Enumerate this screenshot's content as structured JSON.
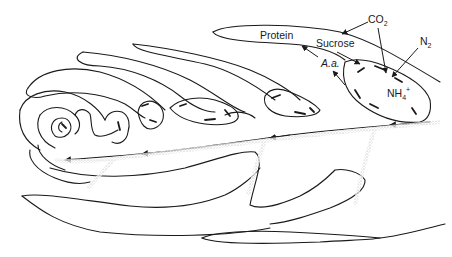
{
  "diagram": {
    "labels": {
      "protein": "Protein",
      "co2_main": "CO",
      "co2_sub": "2",
      "sucrose": "Sucrose",
      "n2_main": "N",
      "n2_sub": "2",
      "aa": "A.a.",
      "nh4_main": "NH",
      "nh4_sub": "4",
      "nh4_sup": "+"
    },
    "colors": {
      "line": "#1a1a1a",
      "stipple": "#9a9a9a",
      "background": "#ffffff"
    },
    "flows": [
      {
        "from": "CO2",
        "to": "Sucrose"
      },
      {
        "from": "CO2",
        "to": "NH4+ region"
      },
      {
        "from": "N2",
        "to": "NH4+ region"
      },
      {
        "from": "Sucrose",
        "to": "nodule"
      },
      {
        "from": "A.a.",
        "to": "Protein"
      },
      {
        "from": "nodule",
        "to": "A.a."
      },
      {
        "from": "stem base",
        "to": "apex",
        "note": "arrows along central axis pointing left"
      }
    ]
  }
}
